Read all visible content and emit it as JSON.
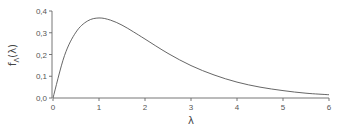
{
  "chart_data": {
    "type": "line",
    "title": "",
    "xlabel": "λ",
    "ylabel_main": "f",
    "ylabel_sub": "Λ",
    "ylabel_arg": "(λ)",
    "xlim": [
      0,
      6
    ],
    "ylim": [
      0,
      0.4
    ],
    "grid": false,
    "legend": "none",
    "x_ticks": [
      0,
      1,
      2,
      3,
      4,
      5,
      6
    ],
    "x_tick_labels": [
      "0",
      "1",
      "2",
      "3",
      "4",
      "5",
      "6"
    ],
    "y_ticks": [
      0,
      0.1,
      0.2,
      0.3,
      0.4
    ],
    "y_tick_labels": [
      "0,0",
      "0,1",
      "0,2",
      "0,3",
      "0,4"
    ],
    "series": [
      {
        "name": "density",
        "color": "#555555",
        "x": [
          0,
          0.25,
          0.5,
          0.75,
          1.0,
          1.25,
          1.5,
          1.75,
          2.0,
          2.5,
          3.0,
          3.5,
          4.0,
          4.5,
          5.0,
          5.5,
          6.0
        ],
        "y": [
          0,
          0.195,
          0.303,
          0.354,
          0.368,
          0.358,
          0.335,
          0.304,
          0.271,
          0.205,
          0.149,
          0.106,
          0.073,
          0.05,
          0.034,
          0.022,
          0.015
        ]
      }
    ]
  }
}
